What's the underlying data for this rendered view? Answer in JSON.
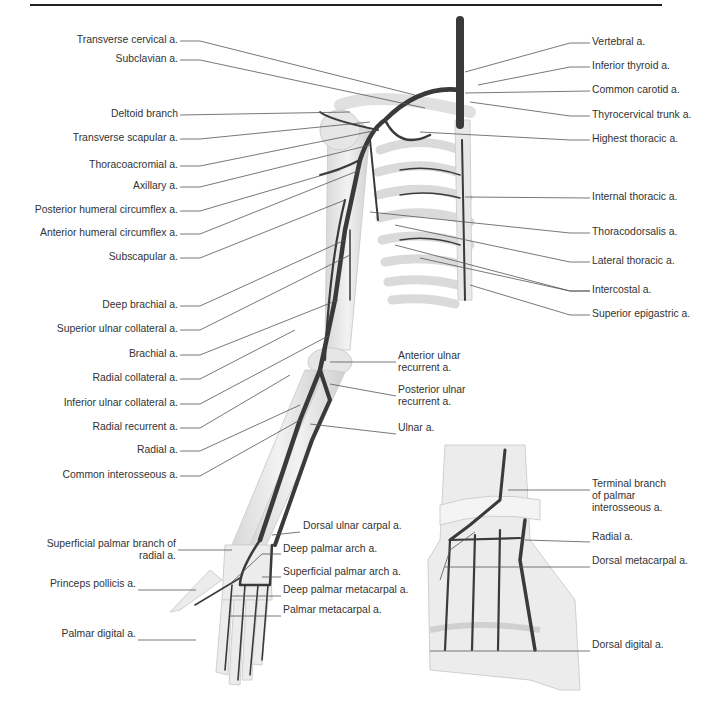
{
  "figure": {
    "top_rule": true,
    "colors": {
      "artery": "#3a3a3a",
      "bone": "#e4e4e4",
      "bone_outline": "#c8c8c8",
      "leader_line": "#555555",
      "label_text": "#333333"
    }
  },
  "left_labels": [
    {
      "text": "Transverse cervical a.",
      "x": 178,
      "y": 40
    },
    {
      "text": "Subclavian a.",
      "x": 178,
      "y": 59
    },
    {
      "text": "Deltoid branch",
      "x": 178,
      "y": 114
    },
    {
      "text": "Transverse scapular a.",
      "x": 178,
      "y": 138
    },
    {
      "text": "Thoracoacromial a.",
      "x": 178,
      "y": 165
    },
    {
      "text": "Axillary a.",
      "x": 178,
      "y": 186
    },
    {
      "text": "Posterior humeral circumflex a.",
      "x": 178,
      "y": 210
    },
    {
      "text": "Anterior humeral circumflex a.",
      "x": 178,
      "y": 233
    },
    {
      "text": "Subscapular a.",
      "x": 178,
      "y": 257
    },
    {
      "text": "Deep brachial a.",
      "x": 178,
      "y": 305
    },
    {
      "text": "Superior ulnar collateral a.",
      "x": 178,
      "y": 329
    },
    {
      "text": "Brachial a.",
      "x": 178,
      "y": 354
    },
    {
      "text": "Radial collateral a.",
      "x": 178,
      "y": 378
    },
    {
      "text": "Inferior ulnar collateral a.",
      "x": 178,
      "y": 403
    },
    {
      "text": "Radial recurrent a.",
      "x": 178,
      "y": 427
    },
    {
      "text": "Radial a.",
      "x": 178,
      "y": 450
    },
    {
      "text": "Common interosseous a.",
      "x": 178,
      "y": 475
    }
  ],
  "right_labels": [
    {
      "text": "Vertebral a.",
      "x": 592,
      "y": 42
    },
    {
      "text": "Inferior thyroid a.",
      "x": 592,
      "y": 66
    },
    {
      "text": "Common carotid a.",
      "x": 592,
      "y": 90
    },
    {
      "text": "Thyrocervical trunk a.",
      "x": 592,
      "y": 115
    },
    {
      "text": "Highest thoracic a.",
      "x": 592,
      "y": 139
    },
    {
      "text": "Internal thoracic a.",
      "x": 592,
      "y": 197
    },
    {
      "text": "Thoracodorsalis a.",
      "x": 592,
      "y": 232
    },
    {
      "text": "Lateral thoracic a.",
      "x": 592,
      "y": 261
    },
    {
      "text": "Intercostal a.",
      "x": 592,
      "y": 290
    },
    {
      "text": "Superior epigastric a.",
      "x": 592,
      "y": 314
    }
  ],
  "elbow_labels": [
    {
      "lines": [
        "Anterior ulnar",
        "recurrent a."
      ],
      "x": 398,
      "y": 356
    },
    {
      "lines": [
        "Posterior ulnar",
        "recurrent a."
      ],
      "x": 398,
      "y": 390
    },
    {
      "lines": [
        "Ulnar a."
      ],
      "x": 398,
      "y": 428
    }
  ],
  "hand_left_labels": [
    {
      "lines": [
        "Superficial palmar branch of",
        "radial a."
      ],
      "x": 176,
      "y": 544
    },
    {
      "lines": [
        "Princeps pollicis a."
      ],
      "x": 136,
      "y": 584
    },
    {
      "lines": [
        "Palmar digital a."
      ],
      "x": 136,
      "y": 634
    }
  ],
  "hand_right_labels": [
    {
      "text": "Dorsal ulnar carpal a.",
      "x": 303,
      "y": 526
    },
    {
      "text": "Deep palmar arch a.",
      "x": 283,
      "y": 549
    },
    {
      "text": "Superficial palmar arch a.",
      "x": 283,
      "y": 572
    },
    {
      "text": "Deep palmar metacarpal a.",
      "x": 283,
      "y": 590
    },
    {
      "text": "Palmar metacarpal a.",
      "x": 283,
      "y": 610
    }
  ],
  "dorsal_hand_labels": [
    {
      "lines": [
        "Terminal branch",
        "of palmar",
        "interosseous a."
      ],
      "x": 592,
      "y": 484
    },
    {
      "lines": [
        "Radial a."
      ],
      "x": 592,
      "y": 537
    },
    {
      "lines": [
        "Dorsal metacarpal a."
      ],
      "x": 592,
      "y": 561
    },
    {
      "lines": [
        "Dorsal digital a."
      ],
      "x": 592,
      "y": 645
    }
  ]
}
